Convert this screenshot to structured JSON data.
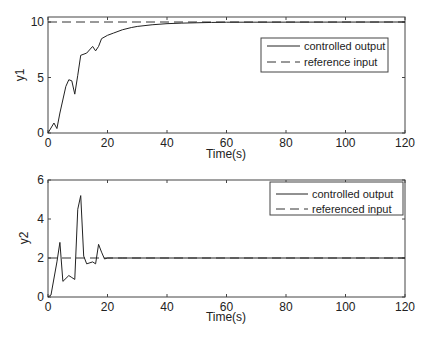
{
  "chart_data": [
    {
      "type": "line",
      "title": "",
      "xlabel": "Time(s)",
      "ylabel": "y1",
      "xlim": [
        0,
        120
      ],
      "ylim": [
        0,
        10.3
      ],
      "xticks": [
        0,
        20,
        40,
        60,
        80,
        100,
        120
      ],
      "yticks": [
        0,
        5,
        10
      ],
      "grid": false,
      "legend_position": "upper right",
      "series": [
        {
          "name": "controlled output",
          "style": "solid",
          "x": [
            0,
            2,
            3,
            4,
            6,
            7,
            8,
            9,
            10,
            11,
            13,
            15,
            16,
            17,
            18,
            20,
            22,
            25,
            28,
            30,
            35,
            40,
            45,
            50,
            55,
            60,
            120
          ],
          "y": [
            0,
            0.9,
            0.4,
            1.8,
            4.2,
            4.8,
            4.7,
            3.5,
            5.2,
            7.0,
            7.2,
            7.8,
            7.4,
            7.8,
            8.5,
            8.8,
            9.0,
            9.3,
            9.5,
            9.6,
            9.75,
            9.85,
            9.9,
            9.93,
            9.96,
            9.98,
            10.0
          ]
        },
        {
          "name": "reference input",
          "style": "dashed",
          "x": [
            0,
            120
          ],
          "y": [
            10,
            10
          ]
        }
      ]
    },
    {
      "type": "line",
      "title": "",
      "xlabel": "Time(s)",
      "ylabel": "y2",
      "xlim": [
        0,
        120
      ],
      "ylim": [
        0,
        6
      ],
      "xticks": [
        0,
        20,
        40,
        60,
        80,
        100,
        120
      ],
      "yticks": [
        0,
        2,
        4,
        6
      ],
      "grid": false,
      "legend_position": "upper right",
      "series": [
        {
          "name": "controlled output",
          "style": "solid",
          "x": [
            0,
            1,
            3,
            4,
            5,
            7,
            8,
            9,
            10,
            11,
            12,
            13,
            15,
            16,
            17,
            18,
            19,
            20,
            25,
            120
          ],
          "y": [
            0,
            0.1,
            1.8,
            2.8,
            0.8,
            1.1,
            1.0,
            0.9,
            4.5,
            5.2,
            2.1,
            1.7,
            1.8,
            1.7,
            2.7,
            2.3,
            1.95,
            2.0,
            2.0,
            2.0
          ]
        },
        {
          "name": "referenced input",
          "style": "dashed",
          "x": [
            0,
            120
          ],
          "y": [
            2,
            2
          ]
        }
      ]
    }
  ],
  "plots": {
    "top": {
      "ylabel": "y1",
      "xlabel": "Time(s)",
      "xtick_labels": [
        "0",
        "20",
        "40",
        "60",
        "80",
        "100",
        "120"
      ],
      "ytick_labels": [
        "0",
        "5",
        "10"
      ],
      "legend": [
        "controlled output",
        "reference input"
      ]
    },
    "bottom": {
      "ylabel": "y2",
      "xlabel": "Time(s)",
      "xtick_labels": [
        "0",
        "20",
        "40",
        "60",
        "80",
        "100",
        "120"
      ],
      "ytick_labels": [
        "0",
        "2",
        "4",
        "6"
      ],
      "legend": [
        "controlled output",
        "referenced input"
      ]
    }
  },
  "colors": {
    "line": "#222222",
    "axis": "#444444",
    "background": "#ffffff"
  }
}
